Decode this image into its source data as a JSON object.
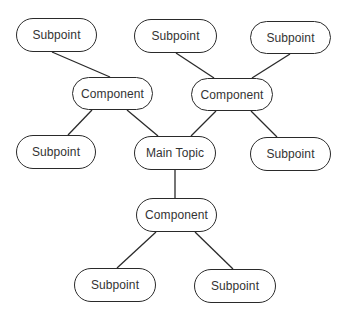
{
  "diagram": {
    "type": "mind-map",
    "nodes": [
      {
        "id": "sp1",
        "label": "Subpoint",
        "x": 16,
        "y": 18,
        "w": 81,
        "h": 34
      },
      {
        "id": "sp2",
        "label": "Subpoint",
        "x": 134,
        "y": 19,
        "w": 83,
        "h": 34
      },
      {
        "id": "sp3",
        "label": "Subpoint",
        "x": 250,
        "y": 21,
        "w": 81,
        "h": 33
      },
      {
        "id": "c1",
        "label": "Component",
        "x": 72,
        "y": 77,
        "w": 81,
        "h": 33
      },
      {
        "id": "c2",
        "label": "Component",
        "x": 191,
        "y": 78,
        "w": 82,
        "h": 33
      },
      {
        "id": "sp4",
        "label": "Subpoint",
        "x": 16,
        "y": 135,
        "w": 80,
        "h": 34
      },
      {
        "id": "main",
        "label": "Main Topic",
        "x": 134,
        "y": 136,
        "w": 82,
        "h": 34
      },
      {
        "id": "sp5",
        "label": "Subpoint",
        "x": 250,
        "y": 137,
        "w": 81,
        "h": 34
      },
      {
        "id": "c3",
        "label": "Component",
        "x": 136,
        "y": 198,
        "w": 81,
        "h": 34
      },
      {
        "id": "sp6",
        "label": "Subpoint",
        "x": 74,
        "y": 268,
        "w": 82,
        "h": 34
      },
      {
        "id": "sp7",
        "label": "Subpoint",
        "x": 194,
        "y": 269,
        "w": 82,
        "h": 34
      }
    ],
    "edges": [
      {
        "from": "sp1",
        "to": "c1",
        "x1": 52,
        "y1": 52,
        "x2": 110,
        "y2": 77
      },
      {
        "from": "sp2",
        "to": "c2",
        "x1": 176,
        "y1": 53,
        "x2": 214,
        "y2": 78
      },
      {
        "from": "sp3",
        "to": "c2",
        "x1": 290,
        "y1": 54,
        "x2": 252,
        "y2": 78
      },
      {
        "from": "c1",
        "to": "sp4",
        "x1": 92,
        "y1": 110,
        "x2": 68,
        "y2": 135
      },
      {
        "from": "c1",
        "to": "main",
        "x1": 127,
        "y1": 110,
        "x2": 158,
        "y2": 136
      },
      {
        "from": "c2",
        "to": "main",
        "x1": 216,
        "y1": 111,
        "x2": 191,
        "y2": 136
      },
      {
        "from": "c2",
        "to": "sp5",
        "x1": 251,
        "y1": 111,
        "x2": 277,
        "y2": 137
      },
      {
        "from": "main",
        "to": "c3",
        "x1": 175,
        "y1": 170,
        "x2": 175,
        "y2": 198
      },
      {
        "from": "c3",
        "to": "sp6",
        "x1": 156,
        "y1": 232,
        "x2": 117,
        "y2": 268
      },
      {
        "from": "c3",
        "to": "sp7",
        "x1": 195,
        "y1": 232,
        "x2": 233,
        "y2": 269
      }
    ]
  }
}
